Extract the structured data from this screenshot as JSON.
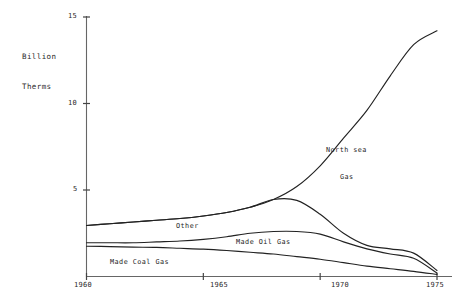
{
  "chart_data": {
    "type": "line",
    "title": "",
    "subtitle": "",
    "xlabel": "",
    "ylabel": "Billion\nTherms",
    "ylabel_line1": "Billion",
    "ylabel_line2": "Therms",
    "xlim": [
      1960,
      1975
    ],
    "ylim": [
      0,
      15
    ],
    "yticks": [
      5,
      10,
      15
    ],
    "ytick_labels": [
      "5",
      "10",
      "15"
    ],
    "xticks": [
      1960,
      1965,
      1970,
      1975
    ],
    "xtick_labels": [
      "1960",
      "1965",
      "1970",
      "1975"
    ],
    "grid": false,
    "legend_position": "inline-annotations",
    "units": "Billion Therms",
    "series": [
      {
        "name": "Total (incl. North sea Gas)",
        "label": "North sea\nGas",
        "label_line1": "North sea",
        "label_line2": "Gas",
        "x": [
          1960,
          1961,
          1962,
          1963,
          1964,
          1965,
          1966,
          1967,
          1968,
          1969,
          1970,
          1971,
          1972,
          1973,
          1974,
          1975
        ],
        "values": [
          2.95,
          3.05,
          3.15,
          3.25,
          3.35,
          3.5,
          3.7,
          4.0,
          4.45,
          5.2,
          6.4,
          8.0,
          9.6,
          11.6,
          13.4,
          14.2
        ]
      },
      {
        "name": "Other",
        "label": "Other",
        "x": [
          1960,
          1961,
          1962,
          1963,
          1964,
          1965,
          1966,
          1967,
          1968,
          1969,
          1970,
          1971,
          1972,
          1973,
          1974,
          1975
        ],
        "values": [
          2.95,
          3.05,
          3.15,
          3.25,
          3.35,
          3.5,
          3.7,
          4.0,
          4.45,
          4.4,
          3.6,
          2.5,
          1.8,
          1.6,
          1.35,
          0.35
        ]
      },
      {
        "name": "Made Oil Gas",
        "label": "Made Oil Gas",
        "x": [
          1960,
          1961,
          1962,
          1963,
          1964,
          1965,
          1966,
          1967,
          1968,
          1969,
          1970,
          1971,
          1972,
          1973,
          1974,
          1975
        ],
        "values": [
          1.95,
          1.95,
          1.95,
          2.0,
          2.05,
          2.15,
          2.3,
          2.5,
          2.6,
          2.6,
          2.45,
          2.0,
          1.6,
          1.3,
          1.05,
          0.2
        ]
      },
      {
        "name": "Made Coal Gas",
        "label": "Made Coal Gas",
        "x": [
          1960,
          1961,
          1962,
          1963,
          1964,
          1965,
          1966,
          1967,
          1968,
          1969,
          1970,
          1971,
          1972,
          1973,
          1974,
          1975
        ],
        "values": [
          1.75,
          1.73,
          1.7,
          1.68,
          1.63,
          1.58,
          1.5,
          1.4,
          1.3,
          1.15,
          1.0,
          0.8,
          0.6,
          0.45,
          0.3,
          0.12
        ]
      }
    ],
    "colors": {
      "line": "#222222",
      "axis": "#555555",
      "text": "#2a2a2a",
      "background": "#ffffff"
    }
  }
}
